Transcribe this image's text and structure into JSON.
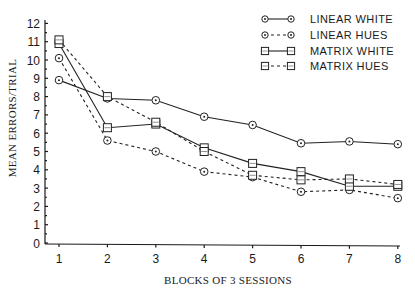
{
  "chart_data": {
    "type": "line",
    "title": "",
    "xlabel": "BLOCKS OF 3 SESSIONS",
    "ylabel": "MEAN ERRORS/TRIAL",
    "x": [
      1,
      2,
      3,
      4,
      5,
      6,
      7,
      8
    ],
    "xticks": [
      "1",
      "2",
      "3",
      "4",
      "5",
      "6",
      "7",
      "8"
    ],
    "yticks": [
      "0",
      "1",
      "2",
      "3",
      "4",
      "5",
      "6",
      "7",
      "8",
      "9",
      "10",
      "11",
      "12"
    ],
    "xlim": [
      1,
      8
    ],
    "ylim": [
      0,
      12
    ],
    "grid": false,
    "legend_position": "upper right",
    "series": [
      {
        "name": "LINEAR WHITE",
        "marker": "circle",
        "linestyle": "solid",
        "values": [
          8.9,
          7.9,
          7.8,
          6.9,
          6.45,
          5.45,
          5.55,
          5.4
        ]
      },
      {
        "name": "LINEAR HUES",
        "marker": "circle",
        "linestyle": "dashed",
        "values": [
          10.1,
          5.6,
          5.0,
          3.9,
          3.6,
          2.8,
          2.9,
          2.45
        ]
      },
      {
        "name": "MATRIX WHITE",
        "marker": "square",
        "linestyle": "solid",
        "values": [
          10.9,
          6.3,
          6.5,
          5.2,
          4.35,
          3.9,
          3.1,
          3.1
        ]
      },
      {
        "name": "MATRIX HUES",
        "marker": "square",
        "linestyle": "dashed",
        "values": [
          11.1,
          8.0,
          6.6,
          5.0,
          3.7,
          3.45,
          3.5,
          3.2
        ]
      }
    ]
  },
  "legend": {
    "items": [
      {
        "label": "LINEAR WHITE"
      },
      {
        "label": "LINEAR HUES"
      },
      {
        "label": "MATRIX WHITE"
      },
      {
        "label": "MATRIX HUES"
      }
    ]
  }
}
